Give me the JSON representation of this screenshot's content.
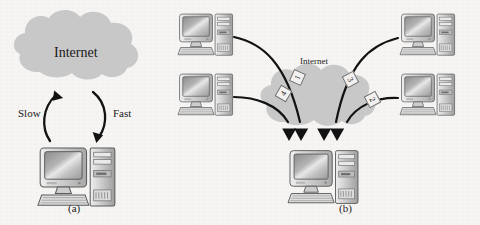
{
  "figure": {
    "type": "network-diagram",
    "background_color": "#f6f5f3",
    "width": 480,
    "height": 225
  },
  "panel_a": {
    "caption": "(a)",
    "cloud_label": "Internet",
    "cloud_color": "#c9c8c8",
    "uplink_label": "Slow",
    "downlink_label": "Fast",
    "device_name": "desktop-computer"
  },
  "panel_b": {
    "caption": "(b)",
    "cloud_label": "Internet",
    "cloud_color": "#c9c8c8",
    "arrow_labels": [
      "1",
      "2",
      "3",
      "4"
    ],
    "sources": [
      {
        "id": "top-left",
        "label": ""
      },
      {
        "id": "bottom-left",
        "label": ""
      },
      {
        "id": "top-right",
        "label": ""
      },
      {
        "id": "bottom-right",
        "label": ""
      }
    ],
    "destination": {
      "id": "bottom-center",
      "label": ""
    }
  }
}
